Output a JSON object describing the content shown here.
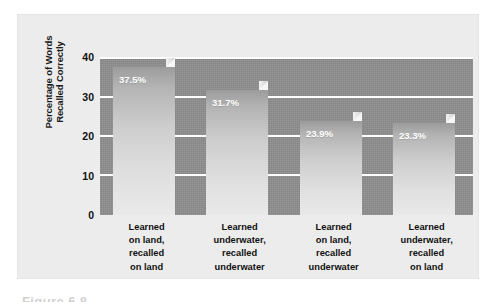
{
  "figure": {
    "caption": "Figure 6.8",
    "card_bg": "#ececec",
    "plot_bg": "#8e8e8e",
    "gridline_color": "#ffffff",
    "bar_light": "#e9e9e9",
    "bar_dark": "#9c9c9c",
    "value_label_color": "#ffffff"
  },
  "chart_data": {
    "type": "bar",
    "title": "",
    "subtitle": "",
    "xlabel": "",
    "ylabel": "Percentage of Words Recalled Correctly",
    "ylabel_lines": [
      "Percentage of Words",
      "Recalled Correctly"
    ],
    "ylim": [
      0,
      40
    ],
    "yticks": [
      0,
      10,
      20,
      30,
      40
    ],
    "ytick_labels": [
      "0",
      "10",
      "20",
      "30",
      "40"
    ],
    "grid": true,
    "grid_axis": "y",
    "legend": false,
    "legend_position": "none",
    "style": "3d-bar",
    "categories": [
      "Learned on land, recalled on land",
      "Learned underwater, recalled underwater",
      "Learned on land, recalled underwater",
      "Learned underwater, recalled on land"
    ],
    "category_lines": [
      [
        "Learned",
        "on land,",
        "recalled",
        "on land"
      ],
      [
        "Learned",
        "underwater,",
        "recalled",
        "underwater"
      ],
      [
        "Learned",
        "on land,",
        "recalled",
        "underwater"
      ],
      [
        "Learned",
        "underwater,",
        "recalled",
        "on land"
      ]
    ],
    "values": [
      37.5,
      31.7,
      23.9,
      23.3
    ],
    "value_labels": [
      "37.5%",
      "31.7%",
      "23.9%",
      "23.3%"
    ]
  }
}
